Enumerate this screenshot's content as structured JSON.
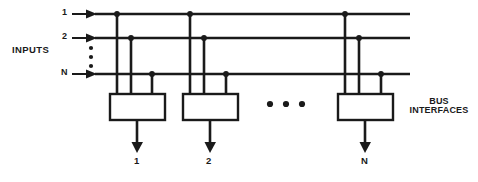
{
  "diagram": {
    "ink_color": "#1a1a1a",
    "background_color": "#ffffff",
    "inputs_label": "INPUTS",
    "input_lines": [
      {
        "label": "1"
      },
      {
        "label": "2"
      },
      {
        "label": "N"
      }
    ],
    "input_vertical_ellipsis": "•",
    "bus_interfaces_label_line1": "BUS",
    "bus_interfaces_label_line2": "INTERFACES",
    "horizontal_ellipsis_dots": 3,
    "bus_interface_boxes": [
      {
        "output_label": "1"
      },
      {
        "output_label": "2"
      },
      {
        "output_label": "N"
      }
    ]
  }
}
